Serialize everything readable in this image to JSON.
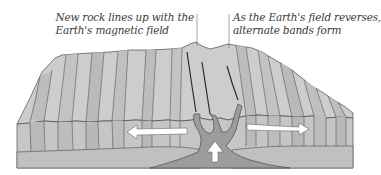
{
  "diagram": {
    "annotations": [
      {
        "id": "left",
        "lines": [
          "New rock lines up with the",
          "Earth's magnetic field"
        ]
      },
      {
        "id": "right",
        "lines": [
          "As the Earth's field reverses,",
          "alternate bands form"
        ]
      }
    ],
    "arrows": [
      {
        "name": "spreading-left",
        "direction": "left"
      },
      {
        "name": "spreading-right",
        "direction": "right"
      },
      {
        "name": "magma-upwelling",
        "direction": "up"
      }
    ],
    "colors": {
      "background": "#ffffff",
      "top_surface": "#cfcfcf",
      "top_surface_alt": "#bdbdbd",
      "front_face": "#c8c8c8",
      "front_face_alt": "#b8b8b8",
      "lower_layer": "#c2c2c2",
      "magma": "#9a9a9a",
      "outline": "#4a4a4a",
      "text": "#3a3a3a",
      "arrow_fill": "#ffffff"
    }
  }
}
